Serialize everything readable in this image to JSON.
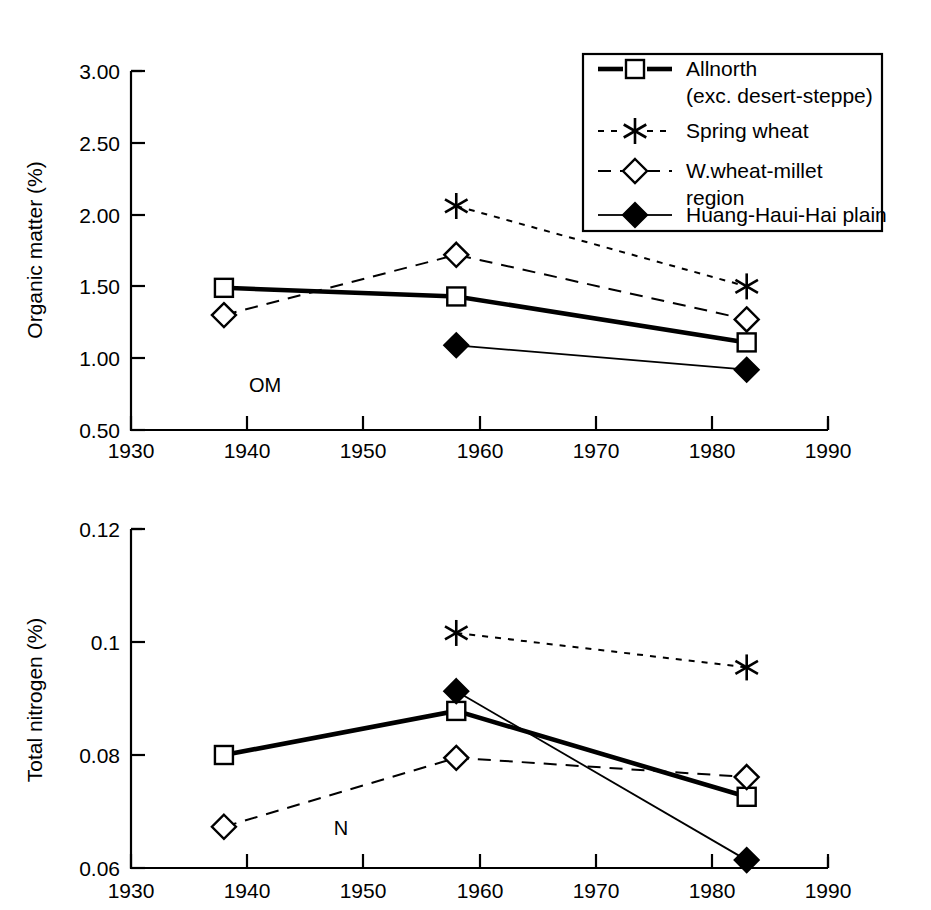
{
  "chart_data": [
    {
      "type": "line",
      "title": "",
      "annotation": "OM",
      "xlabel": "",
      "ylabel": "Organic matter (%)",
      "xlim": [
        1930,
        1990
      ],
      "ylim": [
        0.5,
        3.0
      ],
      "xticks": [
        1930,
        1940,
        1950,
        1960,
        1970,
        1980,
        1990
      ],
      "xtick_labels": [
        "1930",
        "1940",
        "1950",
        "1960",
        "1970",
        "1980",
        "1990"
      ],
      "yticks": [
        0.5,
        1.0,
        1.5,
        2.0,
        2.5,
        3.0
      ],
      "ytick_labels": [
        "0.50",
        "1.00",
        "1.50",
        "2.00",
        "2.50",
        "3.00"
      ],
      "grid": false,
      "x": [
        1938,
        1958,
        1983
      ],
      "series": [
        {
          "name": "Allnorth (exc. desert-steppe)",
          "marker": "open-square",
          "line": "solid-thick",
          "x": [
            1938,
            1958,
            1983
          ],
          "values": [
            1.49,
            1.43,
            1.11
          ]
        },
        {
          "name": "Spring wheat",
          "marker": "asterisk",
          "line": "dotted",
          "x": [
            1958,
            1983
          ],
          "values": [
            2.06,
            1.5
          ]
        },
        {
          "name": "W.wheat-millet region",
          "marker": "open-diamond",
          "line": "dashed",
          "x": [
            1938,
            1958,
            1983
          ],
          "values": [
            1.3,
            1.72,
            1.27
          ]
        },
        {
          "name": "Huang-Haui-Hai plain",
          "marker": "filled-diamond",
          "line": "solid-thin",
          "x": [
            1958,
            1983
          ],
          "values": [
            1.09,
            0.92
          ]
        }
      ]
    },
    {
      "type": "line",
      "title": "",
      "annotation": "N",
      "xlabel": "",
      "ylabel": "Total nitrogen (%)",
      "xlim": [
        1930,
        1990
      ],
      "ylim": [
        0.06,
        0.12
      ],
      "xticks": [
        1930,
        1940,
        1950,
        1960,
        1970,
        1980,
        1990
      ],
      "xtick_labels": [
        "1930",
        "1940",
        "1950",
        "1960",
        "1970",
        "1980",
        "1990"
      ],
      "yticks": [
        0.06,
        0.08,
        0.1,
        0.12
      ],
      "ytick_labels": [
        "0.06",
        "0.08",
        "0.1",
        "0.12"
      ],
      "grid": false,
      "x": [
        1938,
        1958,
        1983
      ],
      "series": [
        {
          "name": "Allnorth (exc. desert-steppe)",
          "marker": "open-square",
          "line": "solid-thick",
          "x": [
            1938,
            1958,
            1983
          ],
          "values": [
            0.08,
            0.0878,
            0.0726
          ]
        },
        {
          "name": "Spring wheat",
          "marker": "asterisk",
          "line": "dotted",
          "x": [
            1958,
            1983
          ],
          "values": [
            0.1016,
            0.0955
          ]
        },
        {
          "name": "W.wheat-millet region",
          "marker": "open-diamond",
          "line": "dashed",
          "x": [
            1938,
            1958,
            1983
          ],
          "values": [
            0.0673,
            0.0795,
            0.0761
          ]
        },
        {
          "name": "Huang-Haui-Hai plain",
          "marker": "filled-diamond",
          "line": "solid-thin",
          "x": [
            1958,
            1983
          ],
          "values": [
            0.0913,
            0.0614
          ]
        }
      ]
    }
  ],
  "legend": {
    "position": "top-right",
    "entries": [
      {
        "label_line1": "Allnorth",
        "label_line2": "(exc. desert-steppe)",
        "marker": "open-square",
        "line": "solid-thick"
      },
      {
        "label_line1": "Spring wheat",
        "label_line2": "",
        "marker": "asterisk",
        "line": "dotted"
      },
      {
        "label_line1": "W.wheat-millet",
        "label_line2": "region",
        "marker": "open-diamond",
        "line": "dashed"
      },
      {
        "label_line1": "Huang-Haui-Hai plain",
        "label_line2": "",
        "marker": "filled-diamond",
        "line": "solid-thin"
      }
    ]
  },
  "colors": {
    "foreground": "#000000",
    "background": "#ffffff"
  }
}
